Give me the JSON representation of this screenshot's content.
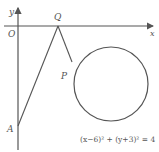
{
  "diagram": {
    "type": "coordinate-geometry",
    "axes": {
      "x_label": "x",
      "y_label": "y",
      "origin_label": "O"
    },
    "points": {
      "Q": {
        "label": "Q",
        "description": "point on x-axis"
      },
      "P": {
        "label": "P",
        "description": "point on circle"
      },
      "A": {
        "label": "A",
        "description": "point on negative y-axis"
      }
    },
    "circle": {
      "equation": "(x−6)² + (y+3)² = 4",
      "center": [
        6,
        -3
      ],
      "radius": 2
    },
    "segments": [
      "AQ",
      "QP"
    ],
    "colors": {
      "line": "#555555",
      "background": "#ffffff"
    }
  }
}
